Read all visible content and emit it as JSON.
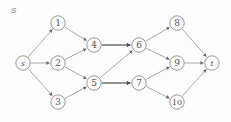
{
  "figure": {
    "corner_label": "S",
    "corner_label_x": 11,
    "corner_label_y": 6
  },
  "graph_data": {
    "type": "directed-graph",
    "width": 231,
    "height": 122,
    "node_radius": 7.2,
    "nodes": [
      {
        "id": "s",
        "label": "s",
        "x": 23,
        "y": 63,
        "style": "small"
      },
      {
        "id": "1",
        "label": "1",
        "x": 58,
        "y": 23,
        "style": "normal"
      },
      {
        "id": "2",
        "label": "2",
        "x": 58,
        "y": 63,
        "style": "normal"
      },
      {
        "id": "3",
        "label": "3",
        "x": 58,
        "y": 102,
        "style": "normal"
      },
      {
        "id": "4",
        "label": "4",
        "x": 94,
        "y": 45,
        "style": "normal"
      },
      {
        "id": "5",
        "label": "5",
        "x": 94,
        "y": 83,
        "style": "normal"
      },
      {
        "id": "6",
        "label": "6",
        "x": 139,
        "y": 45,
        "style": "normal"
      },
      {
        "id": "7",
        "label": "7",
        "x": 139,
        "y": 83,
        "style": "normal"
      },
      {
        "id": "8",
        "label": "8",
        "x": 177,
        "y": 23,
        "style": "normal"
      },
      {
        "id": "9",
        "label": "9",
        "x": 177,
        "y": 63,
        "style": "normal"
      },
      {
        "id": "10",
        "label": "10",
        "x": 177,
        "y": 102,
        "style": "two-digit"
      },
      {
        "id": "t",
        "label": "t",
        "x": 212,
        "y": 63,
        "style": "small"
      }
    ],
    "edges": [
      {
        "from": "s",
        "to": "1",
        "bold": false
      },
      {
        "from": "s",
        "to": "2",
        "bold": false
      },
      {
        "from": "s",
        "to": "3",
        "bold": false
      },
      {
        "from": "1",
        "to": "4",
        "bold": false
      },
      {
        "from": "2",
        "to": "4",
        "bold": false
      },
      {
        "from": "2",
        "to": "5",
        "bold": false
      },
      {
        "from": "3",
        "to": "5",
        "bold": false
      },
      {
        "from": "4",
        "to": "6",
        "bold": true
      },
      {
        "from": "5",
        "to": "6",
        "bold": false
      },
      {
        "from": "5",
        "to": "7",
        "bold": true
      },
      {
        "from": "6",
        "to": "8",
        "bold": false
      },
      {
        "from": "6",
        "to": "9",
        "bold": false
      },
      {
        "from": "7",
        "to": "9",
        "bold": false
      },
      {
        "from": "7",
        "to": "10",
        "bold": false
      },
      {
        "from": "8",
        "to": "t",
        "bold": false
      },
      {
        "from": "9",
        "to": "t",
        "bold": false
      },
      {
        "from": "10",
        "to": "t",
        "bold": false
      }
    ],
    "colors": {
      "node_stroke": "#8d8d8d",
      "node_fill": "#fbfbfb",
      "edge": "#9a9a9a",
      "edge_bold": "#6f6f6f",
      "label": "#555555",
      "background": "#fdfdfd"
    }
  }
}
